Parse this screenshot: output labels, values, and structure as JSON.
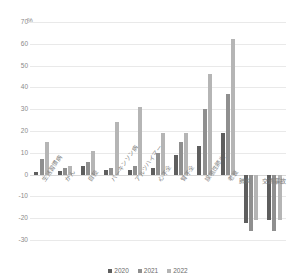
{
  "chart_data": {
    "type": "bar",
    "title": "",
    "subtitle": "",
    "xlabel": "",
    "ylabel": "%",
    "unit_label": "%",
    "ylim": [
      -30,
      70
    ],
    "yticks": [
      70,
      60,
      50,
      40,
      30,
      20,
      10,
      0,
      -10,
      -20,
      -30
    ],
    "ytick_labels": [
      "70",
      "60",
      "50",
      "40",
      "30",
      "20",
      "10",
      "0",
      "-10",
      "-20",
      "-30"
    ],
    "grid": true,
    "legend_position": "bottom",
    "categories": [
      "生活習慣病",
      "がん",
      "自殺",
      "パーキンソン病",
      "アルツハイマー",
      "心不全",
      "腎不全",
      "誤嚥性肺炎",
      "老衰",
      "肺炎",
      "交通事故"
    ],
    "series": [
      {
        "name": "2020",
        "color": "#5e5e5e",
        "values": [
          1,
          1.5,
          4,
          2,
          2,
          3,
          9,
          13,
          19,
          -22,
          -21
        ]
      },
      {
        "name": "2021",
        "color": "#8f8f8f",
        "values": [
          7,
          3,
          6,
          3,
          4,
          10,
          15,
          30,
          37,
          -26,
          -26
        ]
      },
      {
        "name": "2022",
        "color": "#b5b5b5",
        "values": [
          15,
          4,
          11,
          24,
          31,
          19,
          19,
          46,
          62,
          -21,
          -21
        ]
      }
    ],
    "legend": [
      {
        "label": "2020",
        "color": "#5e5e5e"
      },
      {
        "label": "2021",
        "color": "#8f8f8f"
      },
      {
        "label": "2022",
        "color": "#b5b5b5"
      }
    ]
  }
}
